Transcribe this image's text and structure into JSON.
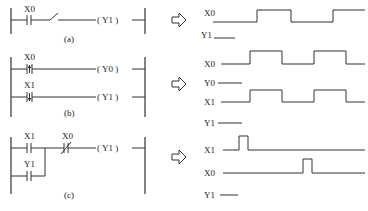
{
  "diagrams": [
    {
      "caption": "(a)",
      "rungs": [
        {
          "contacts": [
            {
              "label": "X0",
              "type": "NO"
            },
            {
              "label": "",
              "type": "open-switch"
            }
          ],
          "coil": "Y1"
        }
      ],
      "timing": [
        {
          "label": "X0",
          "transitions": "low-high-low-high"
        },
        {
          "label": "Y1",
          "transitions": "low"
        }
      ]
    },
    {
      "caption": "(b)",
      "rungs": [
        {
          "contacts": [
            {
              "label": "X0",
              "type": "rising-edge-pulse"
            }
          ],
          "coil": "Y0"
        },
        {
          "contacts": [
            {
              "label": "X1",
              "type": "falling-edge-pulse"
            }
          ],
          "coil": "Y1"
        }
      ],
      "timing": [
        {
          "label": "X0",
          "transitions": "low-high-low-high-low"
        },
        {
          "label": "Y0",
          "transitions": "low"
        },
        {
          "label": "X1",
          "transitions": "low-high-low-high-low"
        },
        {
          "label": "Y1",
          "transitions": "low"
        }
      ]
    },
    {
      "caption": "(c)",
      "rungs": [
        {
          "contacts": [
            {
              "label": "X1",
              "type": "NO"
            },
            {
              "label": "X0",
              "type": "NC"
            }
          ],
          "coil": "Y1",
          "parallel": {
            "label": "Y1",
            "type": "NO"
          }
        }
      ],
      "timing": [
        {
          "label": "X1",
          "transitions": "short-pulse-early"
        },
        {
          "label": "X0",
          "transitions": "short-pulse-late"
        },
        {
          "label": "Y1",
          "transitions": "low"
        }
      ]
    }
  ],
  "labels": {
    "a_x0": "X0",
    "a_coil": "( Y1 )",
    "a_cap": "(a)",
    "a_t_x0": "X0",
    "a_t_y1": "Y1",
    "b_x0": "X0",
    "b_x1": "X1",
    "b_coil0": "( Y0 )",
    "b_coil1": "( Y1 )",
    "b_cap": "(b)",
    "b_t_x0": "X0",
    "b_t_y0": "Y0",
    "b_t_x1": "X1",
    "b_t_y1": "Y1",
    "c_x1": "X1",
    "c_x0": "X0",
    "c_y1": "Y1",
    "c_coil": "( Y1 )",
    "c_cap": "(c)",
    "c_t_x1": "X1",
    "c_t_x0": "X0",
    "c_t_y1": "Y1"
  },
  "arrow_icon": "hollow-right-arrow"
}
